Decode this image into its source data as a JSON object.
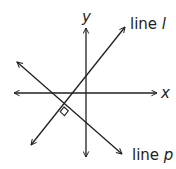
{
  "diagram": {
    "axes": {
      "x_label": "x",
      "y_label": "y"
    },
    "lines": [
      {
        "id": "l",
        "prefix": "line ",
        "name": "l"
      },
      {
        "id": "p",
        "prefix": "line ",
        "name": "p"
      }
    ],
    "annotations": {
      "perpendicular_marker": "right-angle-at-intersection-of-l-and-p"
    },
    "colors": {
      "stroke": "#231f20",
      "background": "#ffffff"
    }
  }
}
